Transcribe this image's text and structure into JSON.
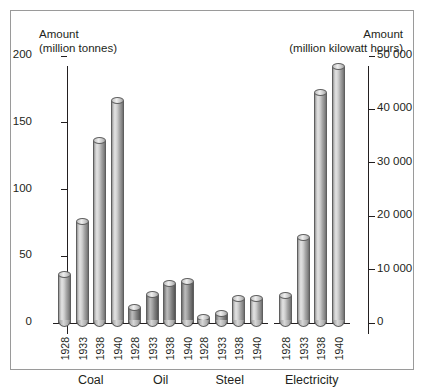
{
  "frame": {
    "border_color": "#9a9a9a"
  },
  "left_axis": {
    "title_line1": "Amount",
    "title_line2": "(million tonnes)",
    "ticks": [
      "200",
      "150",
      "100",
      "50",
      "0"
    ],
    "min": 0,
    "max": 200
  },
  "right_axis": {
    "title_line1": "Amount",
    "title_line2": "(million kilowatt hours)",
    "ticks": [
      "50 000",
      "40 000",
      "30 000",
      "20 000",
      "10 000",
      "0"
    ],
    "min": 0,
    "max": 50000
  },
  "chart_data": {
    "type": "bar",
    "title": "",
    "xlabel": "",
    "ylabel": "Amount (million tonnes)",
    "y2label": "Amount (million kilowatt hours)",
    "ylim": [
      0,
      200
    ],
    "y2lim": [
      0,
      50000
    ],
    "grid": false,
    "legend": "none",
    "categories": [
      "1928",
      "1933",
      "1938",
      "1940"
    ],
    "groups": [
      {
        "name": "Coal",
        "unit": "million tonnes",
        "axis": "left",
        "values": [
          36,
          76,
          136,
          166
        ],
        "bars": [
          {
            "year": "1928",
            "value": 36
          },
          {
            "year": "1933",
            "value": 76
          },
          {
            "year": "1938",
            "value": 136
          },
          {
            "year": "1940",
            "value": 166
          }
        ]
      },
      {
        "name": "Oil",
        "unit": "million tonnes",
        "axis": "left",
        "values": [
          11,
          21,
          29,
          31
        ],
        "bars": [
          {
            "year": "1928",
            "value": 11
          },
          {
            "year": "1933",
            "value": 21
          },
          {
            "year": "1938",
            "value": 29
          },
          {
            "year": "1940",
            "value": 31
          }
        ]
      },
      {
        "name": "Steel",
        "unit": "million tonnes",
        "axis": "left",
        "values": [
          4,
          7,
          18,
          18
        ],
        "bars": [
          {
            "year": "1928",
            "value": 4
          },
          {
            "year": "1933",
            "value": 7
          },
          {
            "year": "1938",
            "value": 18
          },
          {
            "year": "1940",
            "value": 18
          }
        ]
      },
      {
        "name": "Electricity",
        "unit": "million kilowatt hours",
        "axis": "right",
        "values": [
          5000,
          16000,
          43000,
          48000
        ],
        "bars": [
          {
            "year": "1928",
            "value": 5000
          },
          {
            "year": "1933",
            "value": 16000
          },
          {
            "year": "1938",
            "value": 43000
          },
          {
            "year": "1940",
            "value": 48000
          }
        ]
      }
    ]
  }
}
